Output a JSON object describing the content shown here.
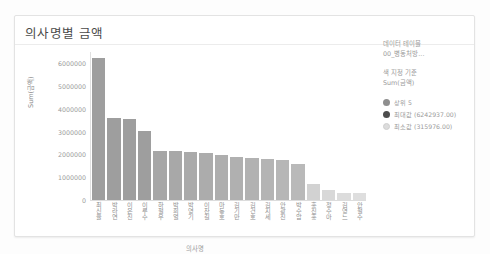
{
  "card": {
    "title": "의사명별 금액"
  },
  "legend": {
    "source_label_1": "데이터 테이블",
    "source_label_2": "00_병동처방...",
    "color_by_label": "색 지정 기준",
    "color_by_value": "Sum(금액)",
    "items": [
      {
        "label": "상위 5",
        "swatch": "mid-gray-circle-icon",
        "color": "#8e8e8e"
      },
      {
        "label": "최대값 (6242937.00)",
        "swatch": "dark-gray-circle-icon",
        "color": "#4d4d4d"
      },
      {
        "label": "최소값 (315976.00)",
        "swatch": "light-gray-circle-icon",
        "color": "#dcdcdc"
      }
    ]
  },
  "chart_data": {
    "type": "bar",
    "title": "의사명별 금액",
    "xlabel": "의사명",
    "ylabel": "Sum(금액)",
    "ylim": [
      0,
      6500000
    ],
    "yticks": [
      6000000,
      5000000,
      4000000,
      3000000,
      2000000,
      1000000,
      0
    ],
    "ytick_labels": [
      "6000000",
      "5000000",
      "4000000",
      "3000000",
      "2000000",
      "1000000",
      "0"
    ],
    "grid": false,
    "legend_position": "right",
    "categories": [
      "최신율",
      "박라연",
      "이은진",
      "이루수",
      "하철우",
      "박희열",
      "박영기",
      "이찬길",
      "마동호",
      "김기만",
      "김건호",
      "김지세",
      "안광진",
      "박수암",
      "홍진홍",
      "정수아",
      "김영느",
      "안철수"
    ],
    "values": [
      6242937,
      3620000,
      3570000,
      3020000,
      2170000,
      2140000,
      2100000,
      2050000,
      1980000,
      1900000,
      1830000,
      1790000,
      1740000,
      1560000,
      700000,
      430000,
      330000,
      315976
    ],
    "bar_colors": [
      "#9e9e9e",
      "#9e9e9e",
      "#9e9e9e",
      "#9e9e9e",
      "#a6a6a6",
      "#a8a8a8",
      "#aaaaaa",
      "#acacac",
      "#aeaeae",
      "#b0b0b0",
      "#b2b2b2",
      "#b4b4b4",
      "#b6b6b6",
      "#b9b9b9",
      "#d2d2d2",
      "#d8d8d8",
      "#dcdcdc",
      "#dedede"
    ]
  }
}
